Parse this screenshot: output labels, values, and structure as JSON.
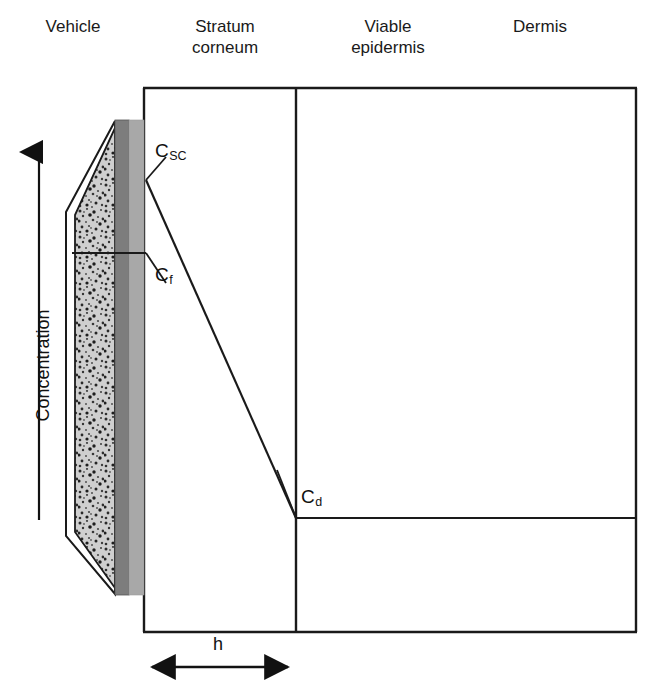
{
  "figure": {
    "type": "skin-permeation-concentration-profile",
    "regions": [
      {
        "id": "vehicle",
        "label": "Vehicle"
      },
      {
        "id": "stratum-corneum",
        "label": "Stratum\ncorneum"
      },
      {
        "id": "viable-epidermis",
        "label": "Viable\nepidermis"
      },
      {
        "id": "dermis",
        "label": "Dermis"
      }
    ],
    "axis": {
      "y_label": "Concentration",
      "y_arrow_direction": "up"
    },
    "concentration_points": [
      {
        "id": "csc",
        "symbol": "C",
        "subscript": "SC",
        "meaning": "concentration at stratum corneum surface"
      },
      {
        "id": "cf",
        "symbol": "C",
        "subscript": "f",
        "meaning": "concentration in formulation / vehicle"
      },
      {
        "id": "cd",
        "symbol": "C",
        "subscript": "d",
        "meaning": "concentration at dermis boundary"
      }
    ],
    "dimension_annotation": {
      "label": "h",
      "meaning": "stratum corneum thickness",
      "arrow": "double-headed-horizontal"
    },
    "colors": {
      "outline": "#1a1a1a",
      "membrane_dark": "#7d7d7d",
      "membrane_light": "#a8a8a8",
      "patch_fill": "#c9c9c9",
      "background": "#ffffff"
    },
    "elements": {
      "vehicle_patch": "speckled-reservoir-patch",
      "membrane_dark_bar": "rate-controlling-membrane",
      "membrane_light_bar": "adhesive-layer",
      "profile_line": "declining-concentration-gradient-across-stratum-corneum",
      "dermis_plateau_line": "constant-concentration-in-dermis"
    }
  }
}
